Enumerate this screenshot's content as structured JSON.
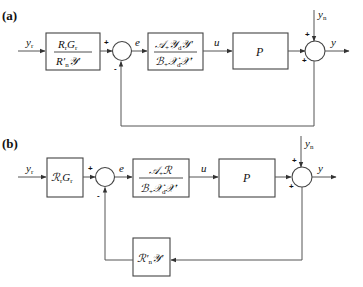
{
  "diagram": {
    "type": "control-block-diagram",
    "panels": [
      {
        "label": "(a)",
        "input_signal": "y",
        "input_sub": "r",
        "prefilter": {
          "num_html": "RᵣGᵣ",
          "num": "RrGr",
          "den": "R'nY'"
        },
        "error_signal": "e",
        "controller": {
          "num": "A+YdY'",
          "den": "B+XdX'"
        },
        "control_signal": "u",
        "plant": "P",
        "noise_signal": "y",
        "noise_sub": "n",
        "output_signal": "y",
        "summer1_signs": [
          "+",
          "-"
        ],
        "summer2_signs": [
          "+",
          "+"
        ]
      },
      {
        "label": "(b)",
        "input_signal": "y",
        "input_sub": "r",
        "prefilter": {
          "text": "RrGr"
        },
        "error_signal": "e",
        "controller": {
          "num": "A+R",
          "den": "B+XdX'"
        },
        "control_signal": "u",
        "plant": "P",
        "noise_signal": "y",
        "noise_sub": "n",
        "output_signal": "y",
        "feedback_block": "R'nY'",
        "summer1_signs": [
          "+",
          "-"
        ],
        "summer2_signs": [
          "+",
          "+"
        ]
      }
    ]
  },
  "labels": {
    "a": "(a)",
    "b": "(b)",
    "y": "y",
    "r": "r",
    "n": "n",
    "e": "e",
    "u": "u",
    "P": "P",
    "plus": "+",
    "minus": "-",
    "R": "R",
    "G": "G",
    "Rcal": "ℛ",
    "Ycal": "𝒴",
    "Acal": "𝒜",
    "Bcal": "ℬ",
    "Xcal": "𝒳",
    "d": "d",
    "prime": "′",
    "plussub": "+"
  }
}
